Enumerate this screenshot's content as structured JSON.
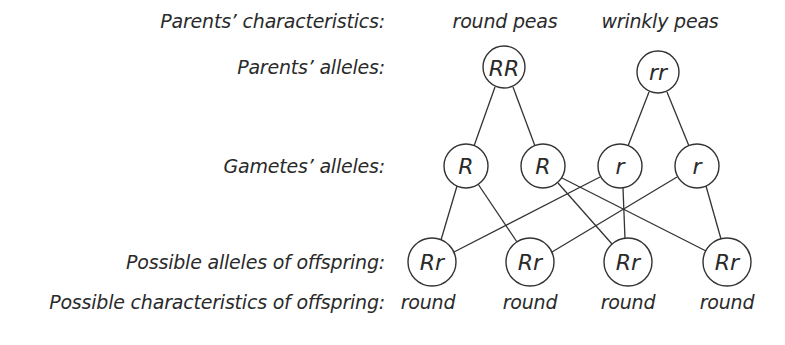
{
  "row_labels": {
    "parents_characteristics": "Parents’ characteristics:",
    "parents_alleles": "Parents’ alleles:",
    "gametes_alleles": "Gametes’ alleles:",
    "offspring_alleles": "Possible alleles of offspring:",
    "offspring_characteristics": "Possible characteristics of offspring:"
  },
  "parents": [
    {
      "characteristic": "round peas",
      "alleles": "RR"
    },
    {
      "characteristic": "wrinkly peas",
      "alleles": "rr"
    }
  ],
  "gametes": [
    {
      "allele": "R",
      "parent": 0
    },
    {
      "allele": "R",
      "parent": 0
    },
    {
      "allele": "r",
      "parent": 1
    },
    {
      "allele": "r",
      "parent": 1
    }
  ],
  "offspring": [
    {
      "alleles": "Rr",
      "characteristic": "round",
      "from_gametes": [
        0,
        2
      ]
    },
    {
      "alleles": "Rr",
      "characteristic": "round",
      "from_gametes": [
        0,
        3
      ]
    },
    {
      "alleles": "Rr",
      "characteristic": "round",
      "from_gametes": [
        1,
        2
      ]
    },
    {
      "alleles": "Rr",
      "characteristic": "round",
      "from_gametes": [
        1,
        3
      ]
    }
  ]
}
